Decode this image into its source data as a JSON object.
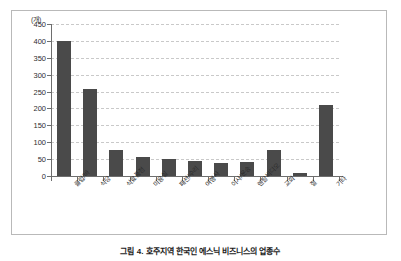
{
  "figure": {
    "caption": "그림 4. 호주지역 한국인 에스닉 비즈니스의 업종수",
    "unit_label": "(개)"
  },
  "chart_data": {
    "type": "bar",
    "title": "",
    "xlabel": "",
    "ylabel": "(개)",
    "ylim": [
      0,
      450
    ],
    "ytick_step": 50,
    "grid": true,
    "legend": "none",
    "bar_color": "#4a4a4a",
    "categories": [
      "클럽/바",
      "식당",
      "식료품점",
      "미용실",
      "패션/수리",
      "여행사",
      "이사/운송",
      "렌탈비디오",
      "교회",
      "절",
      "기타"
    ],
    "values": [
      400,
      257,
      78,
      57,
      50,
      44,
      40,
      41,
      78,
      8,
      211
    ],
    "ytick_labels": [
      "0",
      "50",
      "100",
      "150",
      "200",
      "250",
      "300",
      "350",
      "400",
      "450"
    ]
  }
}
